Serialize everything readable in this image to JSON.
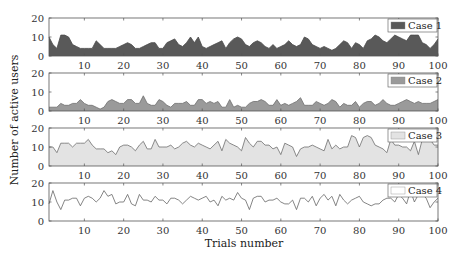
{
  "chart_data": {
    "type": "area",
    "xlabel": "Trials number",
    "ylabel": "Number of active users",
    "xlim": [
      1,
      100
    ],
    "ylim": [
      0,
      20
    ],
    "xticks": [
      10,
      20,
      30,
      40,
      50,
      60,
      70,
      80,
      90,
      100
    ],
    "yticks": [
      0,
      10,
      20
    ],
    "grid": false,
    "legend_position": "upper right (per panel)",
    "panels": [
      {
        "name": "Case 1",
        "fill": "#595959",
        "line": "#4a4a4a",
        "style": "area",
        "values": [
          10,
          6,
          4,
          11,
          11,
          10,
          6,
          5,
          4,
          4,
          4,
          4,
          8,
          6,
          4,
          4,
          4,
          4,
          5,
          6,
          7,
          6,
          4,
          4,
          5,
          6,
          7,
          7,
          4,
          4,
          7,
          8,
          9,
          6,
          5,
          7,
          10,
          7,
          10,
          5,
          4,
          5,
          6,
          7,
          8,
          4,
          7,
          9,
          10,
          9,
          6,
          5,
          7,
          8,
          7,
          5,
          4,
          6,
          4,
          5,
          6,
          8,
          6,
          5,
          6,
          10,
          9,
          6,
          5,
          4,
          5,
          4,
          3,
          4,
          6,
          8,
          7,
          4,
          7,
          6,
          4,
          8,
          9,
          11,
          10,
          8,
          7,
          9,
          11,
          10,
          9,
          8,
          11,
          11,
          11,
          7,
          6,
          4,
          6,
          9
        ]
      },
      {
        "name": "Case 2",
        "fill": "#9a9a9a",
        "line": "#6e6e6e",
        "style": "area",
        "values": [
          2,
          2,
          2,
          4,
          3,
          3,
          4,
          4,
          6,
          4,
          3,
          3,
          2,
          1,
          2,
          5,
          6,
          5,
          4,
          4,
          6,
          6,
          4,
          4,
          8,
          4,
          3,
          3,
          6,
          5,
          3,
          2,
          4,
          4,
          4,
          5,
          3,
          3,
          6,
          6,
          4,
          5,
          4,
          5,
          2,
          2,
          6,
          2,
          3,
          2,
          2,
          4,
          5,
          5,
          6,
          5,
          3,
          3,
          6,
          3,
          4,
          3,
          4,
          5,
          7,
          3,
          3,
          3,
          5,
          4,
          3,
          4,
          6,
          5,
          2,
          4,
          3,
          3,
          5,
          2,
          4,
          5,
          5,
          3,
          4,
          6,
          4,
          3,
          3,
          4,
          5,
          6,
          5,
          4,
          5,
          4,
          4,
          4,
          5,
          6
        ]
      },
      {
        "name": "Case 3",
        "fill": "#e3e3e3",
        "line": "#6e6e6e",
        "style": "area",
        "values": [
          10,
          10,
          7,
          12,
          12,
          12,
          10,
          12,
          12,
          12,
          14,
          11,
          9,
          9,
          9,
          7,
          8,
          6,
          10,
          11,
          11,
          10,
          8,
          11,
          13,
          9,
          9,
          14,
          10,
          10,
          10,
          11,
          9,
          10,
          12,
          13,
          11,
          10,
          12,
          11,
          10,
          9,
          11,
          13,
          8,
          14,
          12,
          11,
          10,
          8,
          15,
          12,
          10,
          13,
          13,
          11,
          11,
          9,
          10,
          6,
          12,
          11,
          10,
          5,
          9,
          10,
          10,
          11,
          10,
          9,
          8,
          14,
          9,
          11,
          9,
          10,
          10,
          16,
          15,
          10,
          15,
          16,
          15,
          11,
          10,
          9,
          7,
          14,
          11,
          11,
          10,
          10,
          8,
          13,
          6,
          14,
          14,
          14,
          11,
          11
        ]
      },
      {
        "name": "Case 4",
        "fill": "#ffffff",
        "line": "#666666",
        "style": "line",
        "values": [
          9,
          16,
          10,
          6,
          11,
          11,
          12,
          12,
          8,
          12,
          13,
          12,
          10,
          12,
          16,
          13,
          14,
          9,
          10,
          10,
          14,
          9,
          8,
          14,
          11,
          11,
          10,
          13,
          11,
          11,
          9,
          12,
          12,
          11,
          9,
          11,
          13,
          12,
          11,
          12,
          13,
          10,
          11,
          8,
          13,
          11,
          12,
          11,
          15,
          12,
          11,
          6,
          12,
          13,
          13,
          10,
          11,
          11,
          12,
          10,
          9,
          9,
          11,
          6,
          12,
          12,
          10,
          13,
          8,
          12,
          14,
          11,
          13,
          8,
          14,
          11,
          9,
          11,
          12,
          13,
          10,
          9,
          8,
          9,
          9,
          11,
          12,
          12,
          10,
          14,
          12,
          9,
          16,
          10,
          14,
          14,
          12,
          7,
          10,
          12
        ]
      }
    ]
  },
  "labels": {
    "xlabel": "Trials number",
    "ylabel": "Number of active users"
  }
}
